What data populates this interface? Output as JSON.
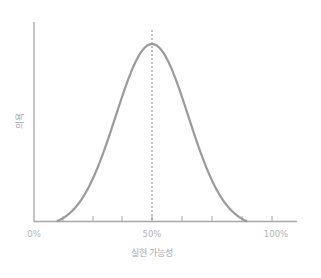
{
  "chart_data": {
    "type": "line",
    "title": "",
    "xlabel": "실현 가능성",
    "ylabel": "의욕",
    "x_tick_labels": [
      "0%",
      "50%",
      "100%"
    ],
    "x_tick_positions": [
      0,
      50,
      100
    ],
    "xlim": [
      0,
      100
    ],
    "ylim": [
      0,
      1
    ],
    "grid": false,
    "legend": null,
    "series": [
      {
        "name": "의욕",
        "shape": "bell curve (normal distribution)",
        "x": [
          10,
          15,
          20,
          25,
          30,
          35,
          40,
          45,
          50,
          55,
          60,
          65,
          70,
          75,
          80,
          85,
          90
        ],
        "values": [
          0.0,
          0.04,
          0.12,
          0.27,
          0.47,
          0.68,
          0.86,
          0.97,
          1.0,
          0.97,
          0.86,
          0.68,
          0.47,
          0.27,
          0.12,
          0.04,
          0.0
        ]
      }
    ],
    "annotations": [
      {
        "type": "vertical-dotted-line",
        "x": 50,
        "label": "peak at 50%"
      }
    ],
    "minor_ticks_x": [
      10,
      20,
      30,
      40,
      50,
      60,
      70,
      80,
      90
    ]
  },
  "colors": {
    "curve": "#9a9a9a",
    "axis": "#a0a0a0",
    "text": "#b4b4b4"
  },
  "labels": {
    "x0": "0%",
    "x50": "50%",
    "x100": "100%",
    "xaxis": "실현 가능성",
    "yaxis": "의욕"
  }
}
